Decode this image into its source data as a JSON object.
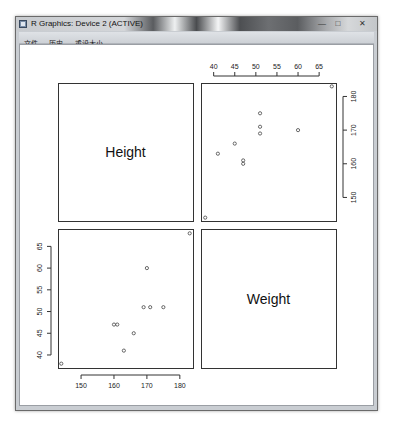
{
  "window": {
    "title": "R Graphics: Device 2 (ACTIVE)",
    "controls": {
      "minimize": "—",
      "maximize": "□",
      "close": "✕"
    },
    "icon": "r-graphics-app-icon"
  },
  "menu": {
    "items": [
      {
        "label": "文件"
      },
      {
        "label": "历史"
      },
      {
        "label": "重设大小"
      }
    ]
  },
  "chart_data": {
    "type": "scatter",
    "kind": "pairs-scatterplot-matrix",
    "variables": [
      "Height",
      "Weight"
    ],
    "diagonal_labels": [
      "Height",
      "Weight"
    ],
    "observations": {
      "Height": [
        144,
        163,
        160,
        161,
        166,
        169,
        171,
        175,
        170,
        183
      ],
      "Weight": [
        38,
        41,
        47,
        47,
        45,
        51,
        51,
        51,
        60,
        68
      ]
    },
    "panels": [
      {
        "position": "top-left",
        "content": "label",
        "label": "Height"
      },
      {
        "position": "top-right",
        "content": "scatter",
        "x": "Weight",
        "y": "Height",
        "xlim": [
          37,
          69
        ],
        "ylim": [
          143,
          184
        ],
        "x_ticks": [
          40,
          45,
          50,
          55,
          60,
          65
        ],
        "x_axis_side": "top",
        "y_ticks": [
          150,
          160,
          170,
          180
        ],
        "y_axis_side": "right"
      },
      {
        "position": "bottom-left",
        "content": "scatter",
        "x": "Height",
        "y": "Weight",
        "xlim": [
          143,
          184
        ],
        "ylim": [
          37,
          69
        ],
        "x_ticks": [
          150,
          160,
          170,
          180
        ],
        "x_axis_side": "bottom",
        "y_ticks": [
          40,
          45,
          50,
          55,
          60,
          65
        ],
        "y_axis_side": "left"
      },
      {
        "position": "bottom-right",
        "content": "label",
        "label": "Weight"
      }
    ],
    "marker": "open-circle",
    "grid": false,
    "title": "",
    "xlabel": "",
    "ylabel": ""
  }
}
